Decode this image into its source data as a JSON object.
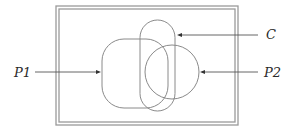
{
  "diagram": {
    "type": "venn-like region diagram",
    "frame": {
      "style": "double-line rectangle",
      "outer": {
        "x": 56,
        "y": 6,
        "width": 182,
        "height": 119
      },
      "inner": {
        "x": 59,
        "y": 9,
        "width": 176,
        "height": 113
      },
      "color": "#9a9a9a"
    },
    "shapes": {
      "P1": {
        "kind": "rounded-rectangle",
        "x": 102,
        "y": 39,
        "width": 66,
        "height": 69,
        "rx": 22
      },
      "C": {
        "kind": "stadium",
        "x": 140,
        "y": 20,
        "width": 35,
        "height": 91,
        "rx": 17.5
      },
      "P2": {
        "kind": "circle",
        "cx": 172,
        "cy": 72,
        "r": 27
      }
    },
    "labels": [
      {
        "id": "C",
        "text": "C",
        "x": 266,
        "y": 39
      },
      {
        "id": "P1",
        "text": "P1",
        "x": 14,
        "y": 77
      },
      {
        "id": "P2",
        "text": "P2",
        "x": 264,
        "y": 77
      }
    ],
    "arrows": [
      {
        "id": "arrow-P1",
        "from": [
          35,
          72
        ],
        "to": [
          101,
          72
        ],
        "target": "P1"
      },
      {
        "id": "arrow-C",
        "from": [
          258,
          35
        ],
        "to": [
          177,
          35
        ],
        "target": "C"
      },
      {
        "id": "arrow-P2",
        "from": [
          258,
          72
        ],
        "to": [
          200,
          72
        ],
        "target": "P2"
      }
    ],
    "colors": {
      "shape_stroke": "#8a8a8a",
      "arrow": "#555555",
      "text": "#2a2a2a",
      "background": "#ffffff"
    }
  }
}
